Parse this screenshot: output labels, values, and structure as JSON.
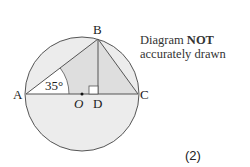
{
  "diagram": {
    "type": "circle-geometry",
    "points": {
      "A": {
        "label": "A",
        "x": 26,
        "y": 94
      },
      "B": {
        "label": "B",
        "x": 98,
        "y": 39
      },
      "C": {
        "label": "C",
        "x": 138,
        "y": 94
      },
      "D": {
        "label": "D",
        "x": 98,
        "y": 94
      },
      "O": {
        "label": "O",
        "x": 82,
        "y": 94
      }
    },
    "circle": {
      "cx": 82,
      "cy": 94,
      "r": 57
    },
    "angle_label": "35°",
    "right_angle_at": "D",
    "colors": {
      "stroke": "#555555",
      "fill_light": "#ececec",
      "fill_mid": "#dedede",
      "sector": "#ffffff"
    }
  },
  "note": {
    "prefix": "Diagram ",
    "bold": "NOT",
    "line2": "accurately drawn"
  },
  "marks": "(2)"
}
